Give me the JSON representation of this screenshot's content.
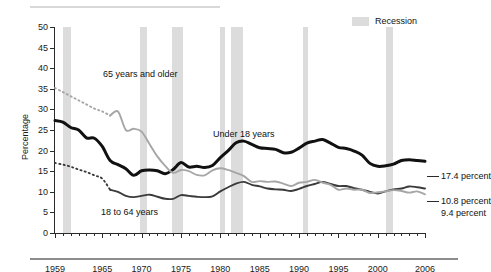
{
  "legend": {
    "label": "Recession",
    "swatch_color": "#dcdcdc"
  },
  "axes": {
    "ylabel": "Percentage",
    "yticks": [
      0,
      5,
      10,
      15,
      20,
      25,
      30,
      35,
      40,
      45,
      50
    ],
    "ylim": [
      0,
      50
    ],
    "xlim": [
      1959,
      2006
    ],
    "xticklabels": [
      "1959",
      "1965",
      "1970",
      "1975",
      "1980",
      "1985",
      "1990",
      "1995",
      "2000",
      "2006"
    ],
    "xtickvalues": [
      1959,
      1965,
      1970,
      1975,
      1980,
      1985,
      1990,
      1995,
      2000,
      2006
    ]
  },
  "series_labels": {
    "older": "65 years and older",
    "under18": "Under 18 years",
    "adults": "18 to 64 years"
  },
  "end_labels": {
    "under18": "17.4 percent",
    "adults": "10.8 percent",
    "older": "9.4 percent"
  },
  "chart_data": {
    "type": "line",
    "title": "",
    "xlabel": "",
    "ylabel": "Percentage",
    "xlim": [
      1959,
      2006
    ],
    "ylim": [
      0,
      50
    ],
    "grid": false,
    "legend_position": "top-right",
    "x": [
      1959,
      1960,
      1961,
      1962,
      1963,
      1964,
      1965,
      1966,
      1967,
      1968,
      1969,
      1970,
      1971,
      1972,
      1973,
      1974,
      1975,
      1976,
      1977,
      1978,
      1979,
      1980,
      1981,
      1982,
      1983,
      1984,
      1985,
      1986,
      1987,
      1988,
      1989,
      1990,
      1991,
      1992,
      1993,
      1994,
      1995,
      1996,
      1997,
      1998,
      1999,
      2000,
      2001,
      2002,
      2003,
      2004,
      2005,
      2006
    ],
    "series": [
      {
        "name": "Under 18 years",
        "color": "#111111",
        "style": "solid",
        "end_label": "17.4 percent",
        "values": [
          27.3,
          26.9,
          25.6,
          25.0,
          23.1,
          23.0,
          21.0,
          17.6,
          16.6,
          15.6,
          14.0,
          15.1,
          15.3,
          15.1,
          14.4,
          15.4,
          17.1,
          16.0,
          16.2,
          15.9,
          16.4,
          18.3,
          20.0,
          21.9,
          22.3,
          21.5,
          20.7,
          20.5,
          20.3,
          19.5,
          19.6,
          20.6,
          21.8,
          22.3,
          22.7,
          21.8,
          20.8,
          20.5,
          19.9,
          18.9,
          16.9,
          16.2,
          16.3,
          16.7,
          17.6,
          17.8,
          17.6,
          17.4
        ]
      },
      {
        "name": "18 to 64 years",
        "color": "#3b3b3b",
        "style": "dotted-then-solid",
        "dotted_until": 1966,
        "end_label": "10.8 percent",
        "values": [
          17.0,
          16.6,
          16.1,
          15.4,
          14.8,
          14.0,
          13.2,
          10.5,
          10.0,
          9.0,
          8.7,
          9.0,
          9.3,
          8.8,
          8.3,
          8.3,
          9.2,
          9.0,
          8.8,
          8.7,
          8.9,
          10.1,
          11.1,
          12.0,
          12.4,
          11.7,
          11.3,
          10.8,
          10.6,
          10.5,
          10.2,
          10.7,
          11.4,
          11.9,
          12.4,
          11.9,
          11.4,
          11.4,
          10.9,
          10.5,
          10.0,
          9.6,
          10.1,
          10.6,
          10.8,
          11.3,
          11.1,
          10.8
        ]
      },
      {
        "name": "65 years and older",
        "color": "#a6a6a6",
        "style": "dotted-then-solid",
        "dotted_until": 1966,
        "end_label": "9.4 percent",
        "values": [
          35.2,
          34.2,
          33.2,
          32.2,
          31.2,
          30.2,
          29.5,
          28.5,
          29.5,
          25.0,
          25.3,
          24.6,
          21.6,
          18.6,
          16.3,
          14.6,
          15.3,
          15.0,
          14.1,
          14.0,
          15.2,
          15.7,
          15.3,
          14.6,
          13.8,
          12.4,
          12.6,
          12.4,
          12.5,
          12.0,
          11.4,
          12.2,
          12.4,
          12.9,
          12.2,
          11.7,
          10.5,
          10.8,
          10.5,
          10.5,
          9.7,
          9.9,
          10.1,
          10.4,
          10.2,
          9.8,
          10.1,
          9.4
        ]
      }
    ],
    "recession_bands": [
      {
        "start": 1960.0,
        "end": 1961.0
      },
      {
        "start": 1969.8,
        "end": 1970.7
      },
      {
        "start": 1973.9,
        "end": 1975.2
      },
      {
        "start": 1980.0,
        "end": 1980.6
      },
      {
        "start": 1981.4,
        "end": 1982.9
      },
      {
        "start": 1990.5,
        "end": 1991.2
      },
      {
        "start": 2001.0,
        "end": 2001.9
      }
    ]
  }
}
